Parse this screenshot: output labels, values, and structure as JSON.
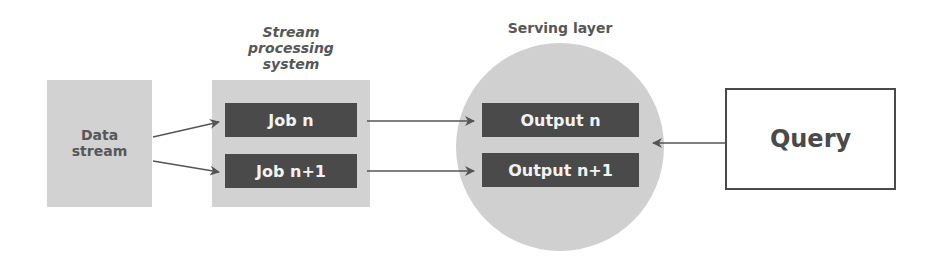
{
  "diagram": {
    "data_stream": {
      "label_line1": "Data",
      "label_line2": "stream"
    },
    "stream_processing": {
      "title_line1": "Stream",
      "title_line2": "processing",
      "title_line3": "system",
      "jobs": [
        "Job n",
        "Job n+1"
      ]
    },
    "serving_layer": {
      "title": "Serving layer",
      "outputs": [
        "Output n",
        "Output n+1"
      ]
    },
    "query": {
      "label": "Query"
    },
    "colors": {
      "box_fill": "#d2d2d2",
      "bar_fill": "#4a4a4a",
      "bar_text": "#f2f2f2",
      "label_text": "#575757",
      "arrow": "#555555"
    }
  }
}
